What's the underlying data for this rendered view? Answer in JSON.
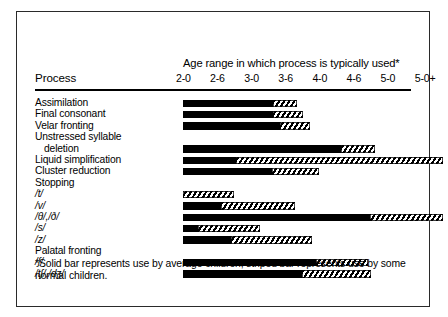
{
  "figure": {
    "process_column_header": "Process",
    "axis_title": "Age range in which process is typically used*",
    "footnote": "*Solid bar represents use by average children; striped bar represents use by some normal children."
  },
  "chart_data": {
    "type": "bar",
    "title": "Age range in which process is typically used*",
    "xlabel": "",
    "ylabel": "Process",
    "grid": false,
    "legend_position": "footnote",
    "tick_labels": [
      "2-0",
      "2-6",
      "3-0",
      "3-6",
      "4-0",
      "4-6",
      "5-0",
      "5-0+"
    ],
    "x_axis_units": "years-months",
    "xlim": [
      "2-0",
      "5-0+"
    ],
    "categories": [
      "Assimilation",
      "Final consonant",
      "Velar fronting",
      "Unstressed syllable deletion",
      "Liquid simplification",
      "Cluster reduction",
      "Stopping",
      "/t/",
      "/v/",
      "/θ/,/ð/",
      "/s/",
      "/z/",
      "Palatal fronting",
      "/ʃ/",
      "/tʃ/,/dʒ/"
    ],
    "series": [
      {
        "name": "Solid bar (average children)",
        "pattern": "solid",
        "values": [
          {
            "start": "2-0",
            "end": "3-0"
          },
          {
            "start": "2-0",
            "end": "3-0"
          },
          {
            "start": "2-0",
            "end": "3-0"
          },
          {
            "start": "2-0",
            "end": "4-3"
          },
          {
            "start": "2-0",
            "end": "2-9"
          },
          {
            "start": "2-0",
            "end": "3-0"
          },
          null,
          {
            "start": "2-0",
            "end": "2-0"
          },
          {
            "start": "2-0",
            "end": "2-6"
          },
          {
            "start": "2-0",
            "end": "4-6"
          },
          {
            "start": "2-0",
            "end": "2-2"
          },
          {
            "start": "2-0",
            "end": "2-7"
          },
          null,
          {
            "start": "2-0",
            "end": "4-0"
          },
          {
            "start": "2-0",
            "end": "3-9"
          }
        ]
      },
      {
        "name": "Striped bar (some normal children)",
        "pattern": "striped",
        "values": [
          {
            "start": "3-0",
            "end": "3-3"
          },
          {
            "start": "3-0",
            "end": "3-4"
          },
          {
            "start": "3-0",
            "end": "3-5"
          },
          {
            "start": "4-3",
            "end": "4-8"
          },
          {
            "start": "2-9",
            "end": "5-0+"
          },
          {
            "start": "3-0",
            "end": "3-6"
          },
          null,
          {
            "start": "2-0",
            "end": "2-9"
          },
          {
            "start": "2-6",
            "end": "3-5"
          },
          {
            "start": "4-6",
            "end": "5-0+"
          },
          {
            "start": "2-2",
            "end": "3-0"
          },
          {
            "start": "2-7",
            "end": "3-8"
          },
          null,
          {
            "start": "4-0",
            "end": "4-9"
          },
          {
            "start": "3-9",
            "end": "4-9"
          }
        ]
      }
    ],
    "rows": [
      {
        "label": "Assimilation",
        "indent": false,
        "ipa": false,
        "solid_end": 90,
        "striped_end": 114
      },
      {
        "label": "Final consonant",
        "indent": false,
        "ipa": false,
        "solid_end": 90,
        "striped_end": 120
      },
      {
        "label": "Velar fronting",
        "indent": false,
        "ipa": false,
        "solid_end": 97,
        "striped_end": 127
      },
      {
        "label": "Unstressed syllable",
        "indent": false,
        "ipa": false,
        "solid_end": null,
        "striped_end": null
      },
      {
        "label": "deletion",
        "indent": true,
        "ipa": false,
        "solid_end": 158,
        "striped_end": 192
      },
      {
        "label": "Liquid simplification",
        "indent": false,
        "ipa": false,
        "solid_end": 53,
        "striped_end": 260
      },
      {
        "label": "Cluster reduction",
        "indent": false,
        "ipa": false,
        "solid_end": 89,
        "striped_end": 136
      },
      {
        "label": "Stopping",
        "indent": false,
        "ipa": false,
        "solid_end": null,
        "striped_end": null
      },
      {
        "label": "/t/",
        "indent": false,
        "ipa": true,
        "solid_end": 0,
        "striped_end": 51
      },
      {
        "label": "/v/",
        "indent": false,
        "ipa": true,
        "solid_end": 38,
        "striped_end": 112
      },
      {
        "label": "/θ/,/ð/",
        "indent": false,
        "ipa": true,
        "solid_end": 187,
        "striped_end": 260
      },
      {
        "label": "/s/",
        "indent": false,
        "ipa": true,
        "solid_end": 15,
        "striped_end": 77
      },
      {
        "label": "/z/",
        "indent": false,
        "ipa": true,
        "solid_end": 48,
        "striped_end": 129
      },
      {
        "label": "Palatal fronting",
        "indent": false,
        "ipa": false,
        "solid_end": null,
        "striped_end": null
      },
      {
        "label": "/ʃ/",
        "indent": false,
        "ipa": true,
        "solid_end": 133,
        "striped_end": 185
      },
      {
        "label": "/tʃ/,/dʒ/",
        "indent": false,
        "ipa": true,
        "solid_end": 119,
        "striped_end": 188
      }
    ]
  }
}
